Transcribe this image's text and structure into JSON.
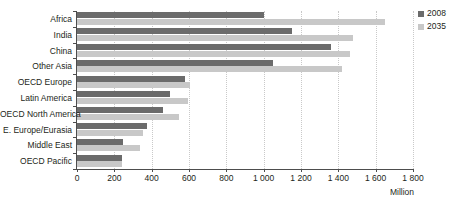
{
  "chart_data": {
    "type": "bar",
    "orientation": "horizontal",
    "title": "",
    "xlabel": "Million",
    "ylabel": "",
    "xlim": [
      0,
      1800
    ],
    "xticks": [
      0,
      200,
      400,
      600,
      800,
      1000,
      1200,
      1400,
      1600,
      1800
    ],
    "xtick_labels": [
      "0",
      "200",
      "400",
      "600",
      "800",
      "1 000",
      "1 200",
      "1 400",
      "1 600",
      "1 800"
    ],
    "grid": "vertical-dotted",
    "legend_position": "right",
    "categories": [
      "Africa",
      "India",
      "China",
      "Other Asia",
      "OECD Europe",
      "Latin America",
      "OECD North America",
      "E. Europe/Eurasia",
      "Middle East",
      "OECD Pacific"
    ],
    "series": [
      {
        "name": "2008",
        "color": "#6b6b6b",
        "values": [
          1000,
          1150,
          1360,
          1050,
          580,
          500,
          460,
          375,
          245,
          240
        ]
      },
      {
        "name": "2035",
        "color": "#c8c8c8",
        "values": [
          1650,
          1480,
          1460,
          1420,
          605,
          595,
          545,
          355,
          340,
          240
        ]
      }
    ]
  },
  "legend": {
    "items": [
      {
        "label": "2008",
        "color": "#6b6b6b"
      },
      {
        "label": "2035",
        "color": "#c8c8c8"
      }
    ]
  },
  "axis": {
    "unit": "Million"
  },
  "colors": {
    "series_2008": "#6b6b6b",
    "series_2035": "#c8c8c8",
    "axis": "#4d4d4d",
    "gridline": "#c9c9c9",
    "text": "#231f20",
    "background": "#ffffff"
  }
}
